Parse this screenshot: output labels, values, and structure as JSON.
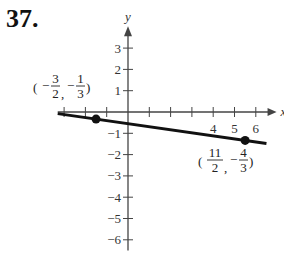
{
  "problem_number": "37.",
  "chart_data": {
    "type": "line",
    "title": "",
    "xlabel": "x",
    "ylabel": "y",
    "xlim": [
      -3.3,
      6.8
    ],
    "ylim": [
      -6.5,
      4
    ],
    "x_tick_labels": [
      "4",
      "5",
      "6"
    ],
    "y_tick_labels": [
      "3",
      "2",
      "1",
      "-1",
      "-2",
      "-3",
      "-4",
      "-5",
      "-6"
    ],
    "grid": false,
    "points": [
      {
        "x": -1.5,
        "y": -0.3333,
        "label_num_x": "3",
        "label_den_x": "2",
        "label_num_y": "1",
        "label_den_y": "3",
        "label": "(-3/2, -1/3)"
      },
      {
        "x": 5.5,
        "y": -1.3333,
        "label_num_x": "11",
        "label_den_x": "2",
        "label_num_y": "4",
        "label_den_y": "3",
        "label": "(11/2, -4/3)"
      }
    ],
    "series": [
      {
        "name": "line through points",
        "slope": -0.142857,
        "intercept": -0.547619
      }
    ]
  }
}
